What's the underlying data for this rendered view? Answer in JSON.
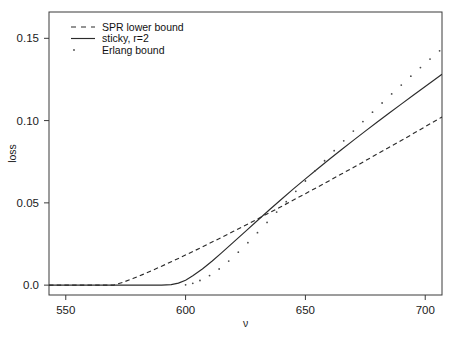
{
  "figure": {
    "background": "#ffffff",
    "foreground": "#2b2b2b"
  },
  "chart_data": {
    "type": "line",
    "title": "",
    "xlabel": "ν",
    "ylabel": "loss",
    "xlim": [
      543,
      707
    ],
    "ylim": [
      -0.006,
      0.166
    ],
    "xticks": [
      550,
      600,
      650,
      700
    ],
    "xtick_labels": [
      "550",
      "600",
      "650",
      "700"
    ],
    "yticks": [
      0.0,
      0.05,
      0.1,
      0.15
    ],
    "ytick_labels": [
      "0.0",
      "0.05",
      "0.10",
      "0.15"
    ],
    "grid": false,
    "legend_position": "top-left",
    "series": [
      {
        "name": "SPR lower bound",
        "style": "dashed",
        "color": "#2b2b2b",
        "x": [
          543,
          550,
          560,
          566,
          570,
          574,
          578,
          582,
          586,
          590,
          594,
          598,
          602,
          606,
          610,
          615,
          620,
          625,
          630,
          635,
          640,
          645,
          650,
          655,
          660,
          665,
          670,
          675,
          680,
          685,
          690,
          695,
          700,
          707
        ],
        "y": [
          0.0,
          0.0,
          0.0,
          0.0,
          0.0,
          0.0018,
          0.004,
          0.0064,
          0.0089,
          0.0115,
          0.0142,
          0.0169,
          0.0197,
          0.0225,
          0.0254,
          0.029,
          0.0327,
          0.0364,
          0.0402,
          0.044,
          0.0478,
          0.0517,
          0.0556,
          0.0595,
          0.0635,
          0.0675,
          0.0715,
          0.0756,
          0.0797,
          0.0838,
          0.0879,
          0.0921,
          0.0963,
          0.1022
        ]
      },
      {
        "name": "sticky, r=2",
        "style": "solid",
        "color": "#2b2b2b",
        "x": [
          543,
          550,
          560,
          570,
          578,
          586,
          590,
          594,
          597,
          600,
          603,
          607,
          611,
          615,
          620,
          625,
          630,
          635,
          640,
          645,
          650,
          655,
          660,
          665,
          670,
          675,
          680,
          685,
          690,
          695,
          700,
          707
        ],
        "y": [
          0.0,
          0.0,
          0.0,
          0.0,
          0.0,
          0.0,
          0.0,
          0.0003,
          0.0012,
          0.003,
          0.0057,
          0.0098,
          0.0145,
          0.0196,
          0.0261,
          0.0327,
          0.0393,
          0.0458,
          0.0522,
          0.0585,
          0.0646,
          0.0706,
          0.0765,
          0.0823,
          0.088,
          0.0936,
          0.0991,
          0.1046,
          0.11,
          0.1154,
          0.1207,
          0.1282
        ]
      },
      {
        "name": "Erlang bound",
        "style": "dotted",
        "color": "#4a4a4a",
        "x": [
          600,
          603,
          606,
          610,
          614,
          618,
          622,
          626,
          630,
          634,
          638,
          642,
          646,
          650,
          654,
          658,
          662,
          666,
          670,
          674,
          678,
          682,
          686,
          690,
          694,
          698,
          702,
          706
        ],
        "y": [
          0.0002,
          0.0011,
          0.0028,
          0.0058,
          0.0098,
          0.0146,
          0.02,
          0.0258,
          0.0319,
          0.0381,
          0.0444,
          0.0507,
          0.057,
          0.0633,
          0.0695,
          0.0756,
          0.0817,
          0.0877,
          0.0936,
          0.0994,
          0.1051,
          0.1107,
          0.1162,
          0.1216,
          0.127,
          0.1322,
          0.1374,
          0.1424
        ]
      }
    ]
  },
  "legend": {
    "entries": [
      {
        "label": "SPR lower bound",
        "style": "dashed"
      },
      {
        "label": "sticky, r=2",
        "style": "solid"
      },
      {
        "label": "Erlang bound",
        "style": "dotted"
      }
    ]
  }
}
